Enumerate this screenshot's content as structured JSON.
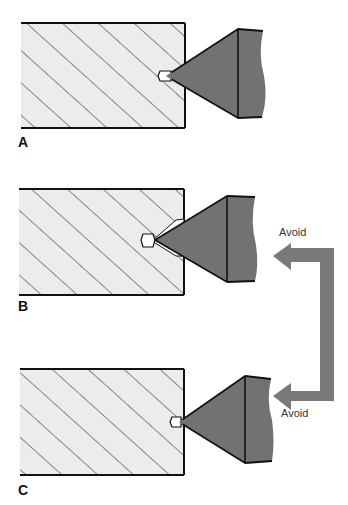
{
  "diagram": {
    "colors": {
      "workpiece_fill": "#ececec",
      "hatch": "#222222",
      "outline": "#111111",
      "tool_fill": "#727272",
      "arrow_fill": "#7a7a7a",
      "insert_fill": "#ffffff"
    },
    "panels": [
      {
        "id": "A",
        "label": "A",
        "description": "Tool tip inserted into small pilot hole"
      },
      {
        "id": "B",
        "label": "B",
        "description": "Tool cutting edges engaged beyond hole chamfer"
      },
      {
        "id": "C",
        "label": "C",
        "description": "Tool tip inserted into pilot hole"
      }
    ],
    "annotations": {
      "avoid_top": "Avoid",
      "avoid_bottom": "Avoid"
    }
  }
}
